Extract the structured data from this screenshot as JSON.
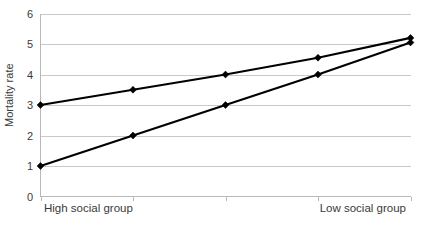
{
  "chart_data": {
    "type": "line",
    "title": "",
    "xlabel": "",
    "ylabel": "Mortality rate",
    "ylim": [
      0,
      6
    ],
    "yticks": [
      0,
      1,
      2,
      3,
      4,
      5,
      6
    ],
    "ytick_labels": [
      "0",
      "1",
      "2",
      "3",
      "4",
      "5",
      "6"
    ],
    "grid": true,
    "legend": "none",
    "x": [
      1,
      2,
      3,
      4,
      5
    ],
    "categories": [
      "High social group",
      "",
      "",
      "",
      "Low social group"
    ],
    "xtick_labels": [
      "High social group",
      "Low social group"
    ],
    "series": [
      {
        "name": "upper-series",
        "values": [
          3,
          3.5,
          4,
          4.55,
          5.2
        ],
        "color": "#000000",
        "marker": "diamond"
      },
      {
        "name": "lower-series",
        "values": [
          1,
          2,
          3,
          4,
          5.05
        ],
        "color": "#000000",
        "marker": "diamond"
      }
    ]
  },
  "axes": {
    "y_title": "Mortality rate",
    "y_labels": [
      "6",
      "5",
      "4",
      "3",
      "2",
      "1",
      "0"
    ],
    "x_label_left": "High social group",
    "x_label_right": "Low social group"
  },
  "colors": {
    "background": "#ffffff",
    "line": "#000000",
    "marker": "#000000",
    "grid": "#c9c9c9",
    "axis": "#b9b9b9",
    "text": "#3a3a3a"
  }
}
